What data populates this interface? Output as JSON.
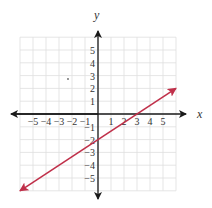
{
  "chart_data": {
    "type": "line",
    "title": "",
    "xlabel": "x",
    "ylabel": "y",
    "xlim": [
      -6,
      6
    ],
    "ylim": [
      -6,
      6
    ],
    "grid": true,
    "x_ticks": [
      "−5",
      "−4",
      "−3",
      "−2",
      "−1",
      "1",
      "2",
      "3",
      "4",
      "5"
    ],
    "y_ticks": [
      "5",
      "4",
      "3",
      "2",
      "1",
      "−1",
      "−2",
      "−3",
      "−4",
      "−5"
    ],
    "series": [
      {
        "name": "line",
        "equation": "y = (2/3)x − 2",
        "slope": 0.6667,
        "y_intercept": -2,
        "x_intercept": 3,
        "x": [
          -6,
          6
        ],
        "y": [
          -6,
          2
        ],
        "color": "#c0304a",
        "arrows": "both"
      }
    ],
    "stray_point": {
      "x": -2,
      "y": 2.7
    }
  },
  "colors": {
    "axis": "#1a1a1a",
    "grid": "#dedede",
    "line": "#c0304a"
  }
}
